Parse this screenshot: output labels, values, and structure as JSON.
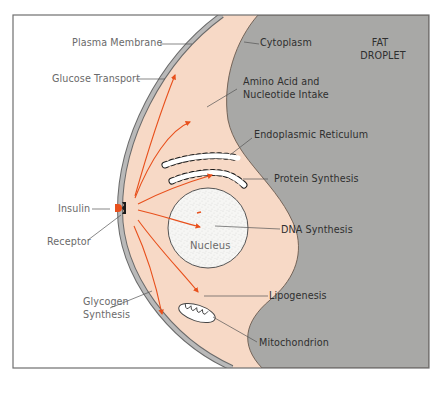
{
  "diagram": {
    "colors": {
      "background": "#ffffff",
      "frame": "#6f6f6f",
      "membrane": "#b9b9b9",
      "membrane_edge": "#6a6a6a",
      "cytoplasm": "#f7d9c6",
      "fat_droplet": "#a8a8a6",
      "fat_droplet_edge": "#6b5a4e",
      "arrow": "#e8501c",
      "leader_line": "#555555",
      "nucleus_fill": "#f6f6f4",
      "ribosome_dot": "#1a1a1a"
    },
    "labels": {
      "plasma_membrane": "Plasma Membrane",
      "glucose_transport": "Glucose Transport",
      "insulin": "Insulin",
      "receptor": "Receptor",
      "glycogen_synthesis_line1": "Glycogen",
      "glycogen_synthesis_line2": "Synthesis",
      "cytoplasm": "Cytoplasm",
      "fat_droplet_line1": "FAT",
      "fat_droplet_line2": "DROPLET",
      "amino_acid_line1": "Amino Acid and",
      "amino_acid_line2": "Nucleotide Intake",
      "endoplasmic_reticulum": "Endoplasmic Reticulum",
      "protein_synthesis": "Protein Synthesis",
      "nucleus": "Nucleus",
      "dna_synthesis": "DNA Synthesis",
      "lipogenesis": "Lipogenesis",
      "mitochondrion": "Mitochondrion"
    }
  }
}
